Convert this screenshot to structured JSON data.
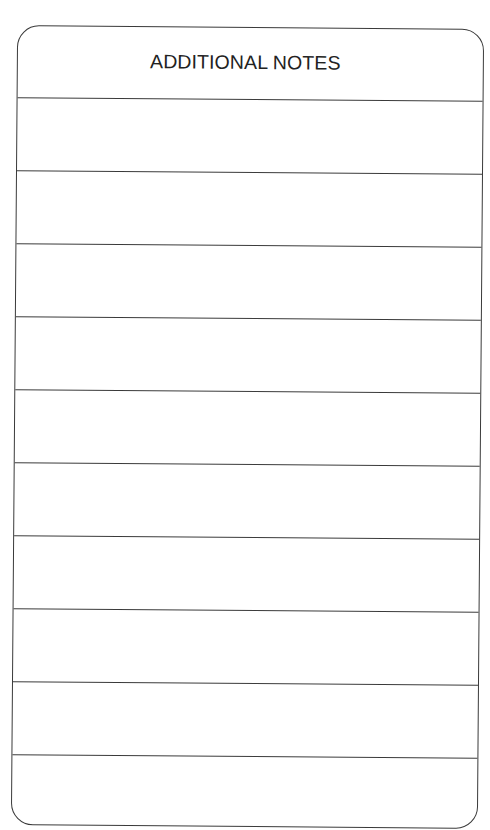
{
  "form": {
    "title": "ADDITIONAL NOTES",
    "line_count": 10,
    "lines": [
      "",
      "",
      "",
      "",
      "",
      "",
      "",
      "",
      "",
      ""
    ]
  },
  "colors": {
    "ink": "#3a3a3a",
    "text": "#222222",
    "paper": "#ffffff"
  }
}
